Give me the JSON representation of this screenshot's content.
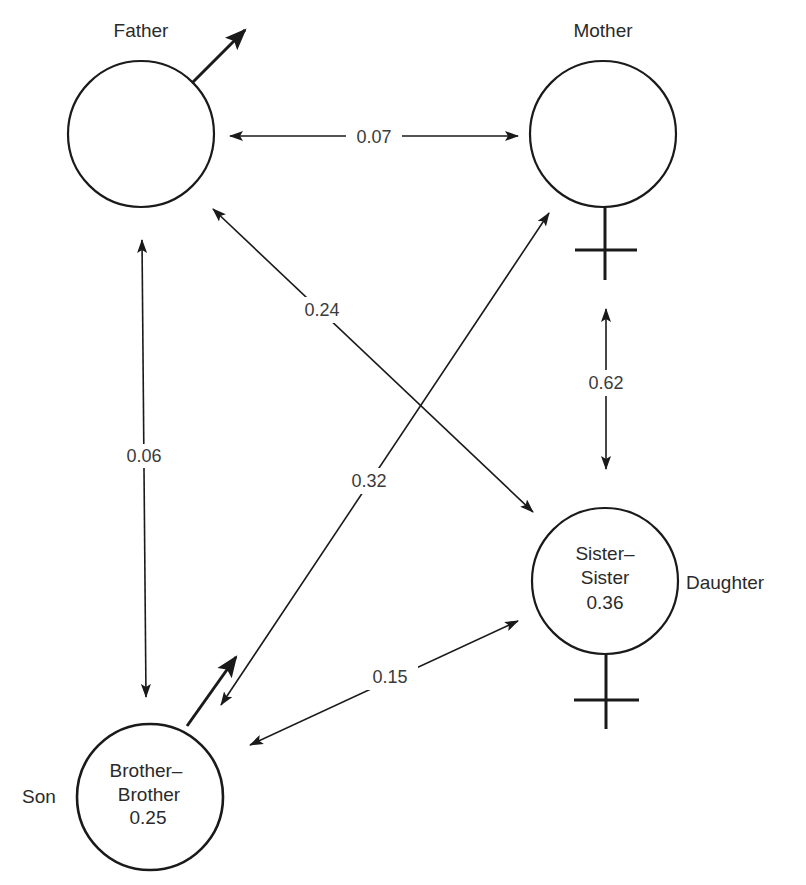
{
  "diagram": {
    "title": "",
    "nodes": [
      {
        "id": "father",
        "label": "Father",
        "sex": "male",
        "inner": []
      },
      {
        "id": "mother",
        "label": "Mother",
        "sex": "female",
        "inner": []
      },
      {
        "id": "daughter",
        "label": "Daughter",
        "sex": "female",
        "inner": [
          "Sister–",
          "Sister",
          "0.36"
        ]
      },
      {
        "id": "son",
        "label": "Son",
        "sex": "male",
        "inner": [
          "Brother–",
          "Brother",
          "0.25"
        ]
      }
    ],
    "edges": [
      {
        "from": "father",
        "to": "mother",
        "label": "0.07",
        "direction": "both"
      },
      {
        "from": "father",
        "to": "son",
        "label": "0.06",
        "direction": "both"
      },
      {
        "from": "father",
        "to": "daughter",
        "label": "0.24",
        "direction": "both"
      },
      {
        "from": "mother",
        "to": "son",
        "label": "0.32",
        "direction": "both"
      },
      {
        "from": "mother",
        "to": "daughter",
        "label": "0.62",
        "direction": "both"
      },
      {
        "from": "son",
        "to": "daughter",
        "label": "0.15",
        "direction": "both"
      }
    ]
  },
  "labels": {
    "father": "Father",
    "mother": "Mother",
    "daughter": "Daughter",
    "son": "Son",
    "daughter_inner_1": "Sister–",
    "daughter_inner_2": "Sister",
    "daughter_inner_3": "0.36",
    "son_inner_1": "Brother–",
    "son_inner_2": "Brother",
    "son_inner_3": "0.25",
    "edge_father_mother": "0.07",
    "edge_father_son": "0.06",
    "edge_father_daughter": "0.24",
    "edge_mother_son": "0.32",
    "edge_mother_daughter": "0.62",
    "edge_son_daughter": "0.15"
  },
  "colors": {
    "ink": "#1a1a1a",
    "text": "#2a2a2a",
    "background": "#ffffff"
  }
}
